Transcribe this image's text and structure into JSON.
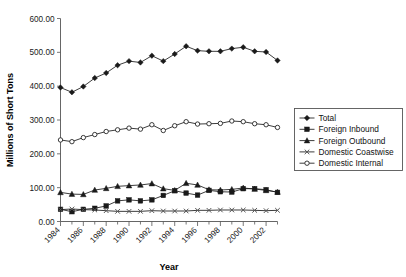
{
  "chart_data": {
    "type": "line",
    "title": "",
    "xlabel": "Year",
    "ylabel": "Millions of Short Tons",
    "ylim": [
      0,
      600
    ],
    "ytick_labels": [
      "0.00",
      "100.00",
      "200.00",
      "300.00",
      "400.00",
      "500.00",
      "600.00"
    ],
    "ytick_values": [
      0,
      100,
      200,
      300,
      400,
      500,
      600
    ],
    "grid": false,
    "legend_position": "right",
    "x": [
      1984,
      1985,
      1986,
      1987,
      1988,
      1989,
      1990,
      1991,
      1992,
      1993,
      1994,
      1995,
      1996,
      1997,
      1998,
      1999,
      2000,
      2001,
      2002,
      2003
    ],
    "xtick_labels": [
      "1984",
      "1986",
      "1988",
      "1990",
      "1992",
      "1994",
      "1996",
      "1998",
      "2000",
      "2002"
    ],
    "xtick_values": [
      1984,
      1986,
      1988,
      1990,
      1992,
      1994,
      1996,
      1998,
      2000,
      2002
    ],
    "series": [
      {
        "name": "Total",
        "marker": "diamond",
        "color": "#1a1a1a",
        "values": [
          396,
          382,
          399,
          424,
          439,
          462,
          474,
          470,
          490,
          474,
          495,
          518,
          505,
          503,
          503,
          511,
          515,
          503,
          501,
          476
        ]
      },
      {
        "name": "Foreign Inbound",
        "marker": "square",
        "color": "#1a1a1a",
        "values": [
          36,
          29,
          36,
          39,
          46,
          61,
          64,
          61,
          64,
          77,
          91,
          84,
          78,
          92,
          88,
          87,
          97,
          97,
          94,
          86
        ]
      },
      {
        "name": "Foreign Outbound",
        "marker": "triangle",
        "color": "#1a1a1a",
        "values": [
          86,
          81,
          80,
          93,
          98,
          104,
          106,
          108,
          112,
          97,
          92,
          113,
          108,
          94,
          93,
          95,
          99,
          96,
          92,
          87
        ]
      },
      {
        "name": "Domestic Coastwise",
        "marker": "cross",
        "color": "#555555",
        "values": [
          35,
          37,
          35,
          34,
          32,
          30,
          30,
          30,
          32,
          31,
          31,
          31,
          33,
          33,
          34,
          34,
          34,
          33,
          32,
          33
        ]
      },
      {
        "name": "Domestic Internal",
        "marker": "circle",
        "color": "#1a1a1a",
        "values": [
          241,
          236,
          248,
          257,
          266,
          271,
          276,
          273,
          286,
          269,
          283,
          295,
          288,
          289,
          290,
          297,
          295,
          289,
          286,
          278
        ]
      }
    ]
  },
  "legend": {
    "items": [
      {
        "label": "Total"
      },
      {
        "label": "Foreign Inbound"
      },
      {
        "label": "Foreign Outbound"
      },
      {
        "label": "Domestic Coastwise"
      },
      {
        "label": "Domestic Internal"
      }
    ]
  }
}
